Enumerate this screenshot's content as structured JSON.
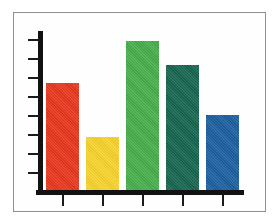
{
  "chart_data": {
    "type": "bar",
    "title": "",
    "subtitle": "",
    "xlabel": "",
    "ylabel": "",
    "categories": [
      "1",
      "2",
      "3",
      "4",
      "5"
    ],
    "values": [
      6.7,
      3.3,
      9.3,
      7.8,
      4.7
    ],
    "ylim": [
      0,
      10
    ],
    "xlim": [
      0,
      5
    ],
    "grid": false,
    "legend": null,
    "legend_position": "none",
    "y_tick_count": 8,
    "x_tick_count": 5,
    "tick_labels_visible": false,
    "bar_colors": [
      "#E8361B",
      "#F8D32C",
      "#46AE4A",
      "#15654F",
      "#1B5FA0"
    ],
    "bars": [
      {
        "label": "1",
        "value": 6.7,
        "color": "#E8361B",
        "color_name": "red"
      },
      {
        "label": "2",
        "value": 3.3,
        "color": "#F8D32C",
        "color_name": "yellow"
      },
      {
        "label": "3",
        "value": 9.3,
        "color": "#46AE4A",
        "color_name": "green"
      },
      {
        "label": "4",
        "value": 7.8,
        "color": "#15654F",
        "color_name": "dark-green"
      },
      {
        "label": "5",
        "value": 4.7,
        "color": "#1B5FA0",
        "color_name": "blue"
      }
    ],
    "annotations": []
  },
  "figure": {
    "background_color": "#ffffff",
    "frame_color": "#8f8f8f",
    "axis_color": "#121212"
  }
}
